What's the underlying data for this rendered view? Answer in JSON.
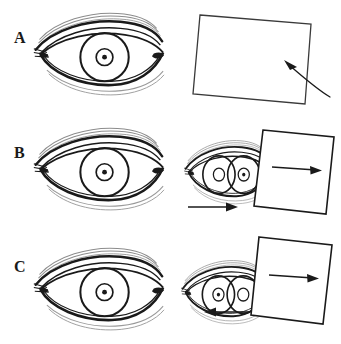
{
  "figure": {
    "background_color": "#ffffff",
    "ink_color": "#1a1a1a",
    "width": 341,
    "height": 344,
    "panel_count": 3
  },
  "rows": [
    {
      "id": "a",
      "label": "A",
      "left_panel": {
        "name": "eye-uncovered-aligned",
        "description": "Front view of a normally aligned right eye with eyelid, lashes, iris and pupil",
        "iris_offset_px": 0,
        "pupil_visible": true
      },
      "right_panel": {
        "name": "occluder-card-approaching",
        "description": "Occluder card held away from the eye, curved arrow indicates card being brought toward the eye",
        "card": {
          "rotation_deg": 4,
          "filled": false,
          "fill": "#ffffff",
          "stroke": "#1a1a1a"
        },
        "arrows": [
          {
            "name": "curved-arrow-to-card",
            "direction": "up-left",
            "style": "curved",
            "inside_card": false
          }
        ],
        "eye_behind_card": false
      }
    },
    {
      "id": "b",
      "label": "B",
      "left_panel": {
        "name": "eye-uncovered-aligned",
        "description": "Front view of a normally aligned right eye with eyelid, lashes, iris and pupil",
        "iris_offset_px": 0,
        "pupil_visible": true
      },
      "right_panel": {
        "name": "occluder-card-covering-eye",
        "description": "Occluder card covers one eye; the covered eye drifts and a second iris outline is visible; card arrow points right",
        "card": {
          "rotation_deg": 6,
          "filled": true,
          "fill": "#ffffff",
          "stroke": "#1a1a1a"
        },
        "arrows": [
          {
            "name": "arrow-inside-card-right",
            "direction": "right",
            "style": "straight",
            "inside_card": true
          },
          {
            "name": "arrow-below-eye-right",
            "direction": "right",
            "style": "straight",
            "inside_card": false
          }
        ],
        "eye_behind_card": true,
        "double_iris": true
      }
    },
    {
      "id": "c",
      "label": "C",
      "left_panel": {
        "name": "eye-uncovered-aligned",
        "description": "Front view of a normally aligned right eye with eyelid, lashes, iris and pupil",
        "iris_offset_px": 0,
        "pupil_visible": true
      },
      "right_panel": {
        "name": "occluder-card-moved-refixation",
        "description": "Occluder card shifted; uncovered eye re-fixates moving nasally, arrow below points left while card arrow points right",
        "card": {
          "rotation_deg": 6,
          "filled": true,
          "fill": "#ffffff",
          "stroke": "#1a1a1a"
        },
        "arrows": [
          {
            "name": "arrow-inside-card-right",
            "direction": "right",
            "style": "straight",
            "inside_card": true
          },
          {
            "name": "arrow-below-eye-left",
            "direction": "left",
            "style": "straight",
            "inside_card": false
          }
        ],
        "eye_behind_card": true,
        "double_iris": true
      }
    }
  ]
}
